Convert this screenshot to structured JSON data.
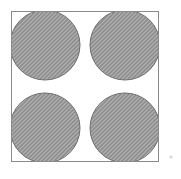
{
  "figure": {
    "title": "Four shaded circles packed in a square",
    "canvas": {
      "width": 181,
      "height": 179,
      "background_color": "#ffffff"
    },
    "square": {
      "name": "bounding-square",
      "x": 11.5,
      "y": 11.5,
      "width": 147,
      "height": 150,
      "fill_color": "#ffffff",
      "stroke_color": "#8a8a8a",
      "stroke_width": 1
    },
    "circles": [
      {
        "name": "circle-top-left",
        "position_label": "top-left",
        "cx": 45,
        "cy": 45,
        "r": 35,
        "fill_color": "#9a9a9a",
        "stroke_color": "#6e6e6e",
        "clipped": true
      },
      {
        "name": "circle-top-right",
        "position_label": "top-right",
        "cx": 125,
        "cy": 45,
        "r": 35,
        "fill_color": "#9a9a9a",
        "stroke_color": "#6e6e6e",
        "clipped": true
      },
      {
        "name": "circle-bottom-left",
        "position_label": "bottom-left",
        "cx": 45,
        "cy": 128,
        "r": 35,
        "fill_color": "#9a9a9a",
        "stroke_color": "#6e6e6e",
        "clipped": true
      },
      {
        "name": "circle-bottom-right",
        "position_label": "bottom-right",
        "cx": 125,
        "cy": 128,
        "r": 35,
        "fill_color": "#9a9a9a",
        "stroke_color": "#6e6e6e",
        "clipped": true
      }
    ],
    "speck": {
      "name": "stray-speck",
      "cx": 171,
      "cy": 157,
      "r": 1.6,
      "fill_color": "#d8d8d8"
    },
    "colors": {
      "background": "#ffffff",
      "square_fill": "#ffffff",
      "square_border": "#8a8a8a",
      "circle_fill": "#9a9a9a",
      "circle_fill_dither_light": "#b4b4b4",
      "circle_fill_dither_dark": "#8c8c8c",
      "circle_edge": "#6e6e6e",
      "speck": "#d8d8d8"
    },
    "labels": {
      "square": "square",
      "circles": "circles",
      "count": "4"
    }
  }
}
